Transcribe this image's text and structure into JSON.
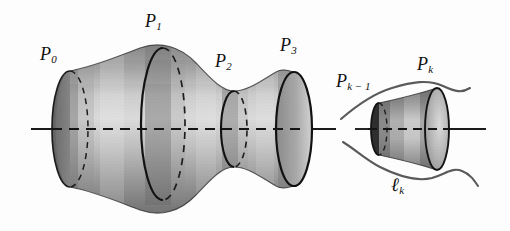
{
  "figure": {
    "name": "surface-of-revolution-with-cross-section-circles",
    "background_color": "#ffffff",
    "width": 510,
    "height": 231,
    "axis_line": {
      "name": "axis-of-revolution",
      "style": "dashed-inside-solid-outside",
      "color": "#1a1a1a",
      "y": 129
    },
    "main_surface": {
      "name": "main-surface-of-revolution",
      "fill_light": "#d2d2d2",
      "fill_mid": "#a8a8a8",
      "fill_dark": "#767676",
      "outline_color": "#1b1b1b"
    },
    "small_surface": {
      "name": "small-tube-segment",
      "fill_light": "#cfcfcf",
      "fill_dark": "#6e6e6e",
      "outline_color": "#1b1b1b"
    },
    "curves": {
      "name": "level-curve-lk",
      "color": "#555555"
    }
  },
  "labels": {
    "p0": {
      "base": "P",
      "sub": "0",
      "x": 40,
      "y": 47
    },
    "p1": {
      "base": "P",
      "sub": "1",
      "x": 145,
      "y": 14
    },
    "p2": {
      "base": "P",
      "sub": "2",
      "x": 219,
      "y": 54
    },
    "p3": {
      "base": "P",
      "sub": "3",
      "x": 281,
      "y": 37
    },
    "pk_minus_1": {
      "base": "P",
      "sub": "k − 1",
      "x": 337,
      "y": 73
    },
    "pk": {
      "base": "P",
      "sub": "k",
      "x": 418,
      "y": 56
    },
    "lk": {
      "base": "ℓ",
      "sub": "k",
      "x": 391,
      "y": 176
    }
  },
  "cross_sections": [
    {
      "name": "circle-p0",
      "label": "P0",
      "cx": 70,
      "rx": 18,
      "ry": 58
    },
    {
      "name": "circle-p1",
      "label": "P1",
      "cx": 163,
      "rx": 22,
      "ry": 76
    },
    {
      "name": "circle-p2",
      "label": "P2",
      "cx": 234,
      "rx": 13,
      "ry": 38
    },
    {
      "name": "circle-p3",
      "label": "P3",
      "cx": 294,
      "rx": 18,
      "ry": 57
    },
    {
      "name": "circle-pk-minus-1",
      "label": "Pk-1",
      "cx": 379,
      "rx": 8,
      "ry": 26
    },
    {
      "name": "circle-pk",
      "label": "Pk",
      "cx": 437,
      "rx": 12,
      "ry": 41
    }
  ]
}
